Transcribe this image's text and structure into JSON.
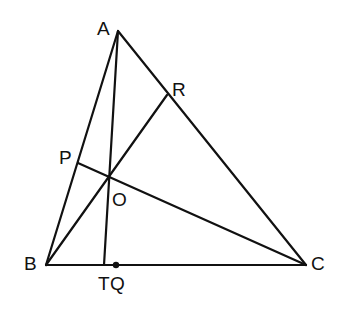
{
  "diagram": {
    "type": "triangle-cevians",
    "stroke_color": "#111111",
    "background": "#ffffff",
    "points": {
      "A": {
        "label": "A",
        "x": 118,
        "y": 31,
        "label_x": 97,
        "label_y": 35
      },
      "B": {
        "label": "B",
        "x": 46,
        "y": 265,
        "label_x": 24,
        "label_y": 270
      },
      "C": {
        "label": "C",
        "x": 306,
        "y": 265,
        "label_x": 311,
        "label_y": 270
      },
      "P": {
        "label": "P",
        "x": 78,
        "y": 163,
        "label_x": 59,
        "label_y": 164
      },
      "R": {
        "label": "R",
        "x": 167,
        "y": 95,
        "label_x": 172,
        "label_y": 96
      },
      "O": {
        "label": "O",
        "x": 109,
        "y": 177,
        "label_x": 112,
        "label_y": 206
      },
      "T": {
        "label": "T",
        "x": 104,
        "y": 265,
        "label_x": 98,
        "label_y": 290
      },
      "Q": {
        "label": "Q",
        "x": 116,
        "y": 265,
        "label_x": 110,
        "label_y": 290
      }
    },
    "segments": [
      {
        "from": "A",
        "to": "B"
      },
      {
        "from": "A",
        "to": "C"
      },
      {
        "from": "B",
        "to": "C"
      },
      {
        "from": "A",
        "to": "T"
      },
      {
        "from": "B",
        "to": "R"
      },
      {
        "from": "C",
        "to": "P"
      }
    ],
    "marked_points": [
      "Q"
    ]
  }
}
